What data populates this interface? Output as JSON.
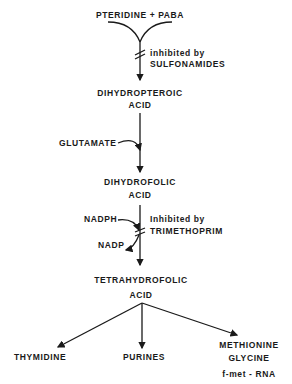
{
  "diagram": {
    "type": "metabolic-pathway",
    "nodes": {
      "start": "PTERIDINE + PABA",
      "dihydropteroic_1": "DIHYDROPTEROIC",
      "dihydropteroic_2": "ACID",
      "glutamate": "GLUTAMATE",
      "dihydrofolic_1": "DIHYDROFOLIC",
      "dihydrofolic_2": "ACID",
      "nadph": "NADPH",
      "nadp": "NADP",
      "tetrahydrofolic_1": "TETRAHYDROFOLIC",
      "tetrahydrofolic_2": "ACID",
      "thymidine": "THYMIDINE",
      "purines": "PURINES",
      "methionine": "METHIONINE",
      "glycine": "GLYCINE",
      "fmet": "f-met - RNA"
    },
    "inhibitions": {
      "sulfonamides_1": "inhibited by",
      "sulfonamides_2": "SULFONAMIDES",
      "trimethoprim_1": "Inhibited by",
      "trimethoprim_2": "TRIMETHOPRIM"
    },
    "colors": {
      "line": "#1a1a1a",
      "background": "#ffffff"
    }
  }
}
